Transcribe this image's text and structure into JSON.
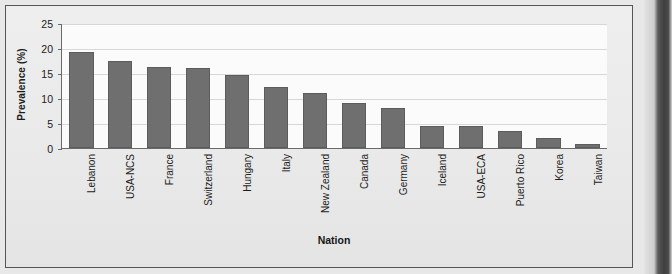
{
  "chart_data": {
    "type": "bar",
    "title": "",
    "xlabel": "Nation",
    "ylabel": "Prevalence (%)",
    "ylim": [
      0,
      25
    ],
    "ytick_values": [
      25,
      20,
      15,
      10,
      5,
      0
    ],
    "ytick_labels": [
      "25",
      "20",
      "15",
      "10",
      "5",
      "0"
    ],
    "grid": true,
    "legend": "none",
    "bar_color": "#6f6f6f",
    "plot_background": "#fbfbfb",
    "figure_background": "#ececec",
    "categories": [
      "Lebanon",
      "USA-NCS",
      "France",
      "Switzerland",
      "Hungary",
      "Italy",
      "New Zealand",
      "Canada",
      "Germany",
      "Iceland",
      "USA-ECA",
      "Puerto Rico",
      "Korea",
      "Taiwan"
    ],
    "values": [
      19.3,
      17.6,
      16.4,
      16.2,
      14.8,
      12.3,
      11.0,
      9.0,
      8.0,
      4.5,
      4.5,
      3.5,
      2.1,
      0.8
    ]
  }
}
